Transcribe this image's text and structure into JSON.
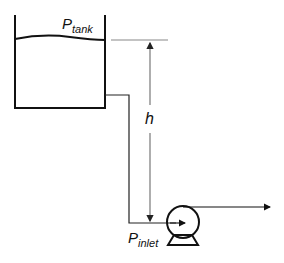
{
  "diagram": {
    "labels": {
      "tank_pressure_main": "P",
      "tank_pressure_sub": "tank",
      "height": "h",
      "inlet_pressure_main": "P",
      "inlet_pressure_sub": "inlet"
    },
    "elements": [
      "open-tank",
      "liquid-surface",
      "outlet-pipe",
      "height-dimension",
      "pump",
      "discharge-arrow"
    ],
    "colors": {
      "stroke": "#111111",
      "dimension": "#777777",
      "background": "#ffffff"
    }
  }
}
